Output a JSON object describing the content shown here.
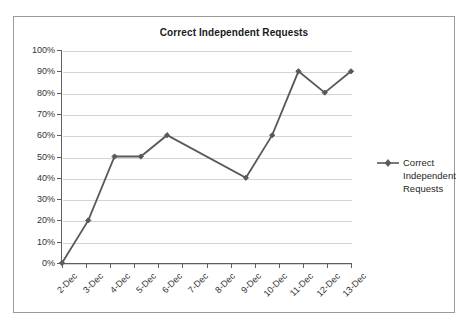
{
  "chart_data": {
    "type": "line",
    "title": "Correct Independent Requests",
    "xlabel": "",
    "ylabel": "",
    "categories": [
      "2-Dec",
      "3-Dec",
      "4-Dec",
      "5-Dec",
      "6-Dec",
      "7-Dec",
      "8-Dec",
      "9-Dec",
      "10-Dec",
      "11-Dec",
      "12-Dec",
      "13-Dec"
    ],
    "series": [
      {
        "name": "Correct Independent Requests",
        "values": [
          0,
          20,
          50,
          50,
          60,
          null,
          null,
          40,
          60,
          90,
          80,
          90
        ],
        "color": "#595959",
        "marker": "diamond"
      }
    ],
    "ylim": [
      0,
      100
    ],
    "y_ticks": [
      0,
      10,
      20,
      30,
      40,
      50,
      60,
      70,
      80,
      90,
      100
    ],
    "y_tick_labels": [
      "0%",
      "10%",
      "20%",
      "30%",
      "40%",
      "50%",
      "60%",
      "70%",
      "80%",
      "90%",
      "100%"
    ],
    "grid": true,
    "grid_axis": "y",
    "grid_color": "#d4d4d4",
    "legend": true,
    "legend_position": "right",
    "axis_color": "#5f5f5f",
    "plot_background": "#ffffff",
    "border_color": "#9a9a9a"
  },
  "legend": {
    "entries": [
      {
        "label": "Correct Independent Requests",
        "color": "#595959"
      }
    ]
  }
}
